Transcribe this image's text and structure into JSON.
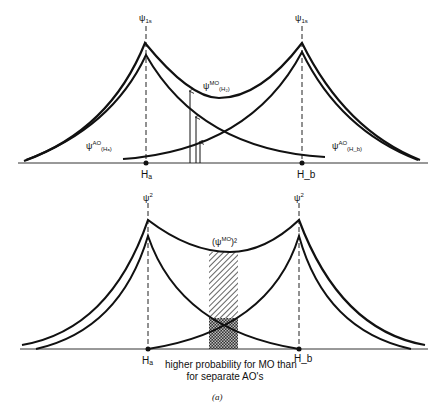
{
  "top_panel": {
    "peak_label_a": "ψ",
    "peak_label_a_sub": "1s",
    "peak_label_b": "ψ",
    "peak_label_b_sub": "1s",
    "mo_label": "ψ",
    "mo_label_sup": "MO",
    "mo_label_sub": "(H₂)",
    "ao_a_label": "ψ",
    "ao_a_sup": "AO",
    "ao_a_sub": "(Hₐ)",
    "ao_b_label": "ψ",
    "ao_b_sup": "AO",
    "ao_b_sub": "(H_b)",
    "nucleus_a": "Hₐ",
    "nucleus_b": "H_b"
  },
  "bottom_panel": {
    "peak_label_a": "ψ",
    "peak_label_a_sup": "2",
    "peak_label_b": "ψ",
    "peak_label_b_sup": "2",
    "mo_sq_label": "(ψ",
    "mo_sq_sup": "MO",
    "mo_sq_tail": ")²",
    "nucleus_a": "Hₐ",
    "nucleus_b": "H_b",
    "caption_line1": "higher probability for MO than",
    "caption_line2": "for separate AO's"
  },
  "figure_label": "(a)",
  "colors": {
    "line": "#111111",
    "background": "#ffffff"
  }
}
